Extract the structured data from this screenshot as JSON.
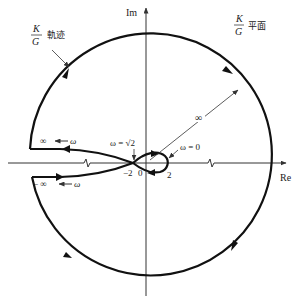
{
  "diagram": {
    "type": "nyquist-plot",
    "plane_label": {
      "numerator": "K",
      "denominator": "G",
      "suffix": "平面"
    },
    "locus_label": {
      "numerator": "K",
      "denominator": "G",
      "suffix": "軌迹"
    },
    "axes": {
      "imag": "Im",
      "real": "Re"
    },
    "annotations": {
      "omega_sqrt2": "ω = √2",
      "omega_zero": "ω = 0",
      "infinite_radius": "∞",
      "upper_branch": "∞ ← ω",
      "lower_branch": "− ∞ ← ω"
    },
    "ticks": {
      "minus_two": "−2",
      "zero": "0",
      "two": "2"
    },
    "colors": {
      "line": "#111111",
      "axis": "#333333"
    }
  }
}
